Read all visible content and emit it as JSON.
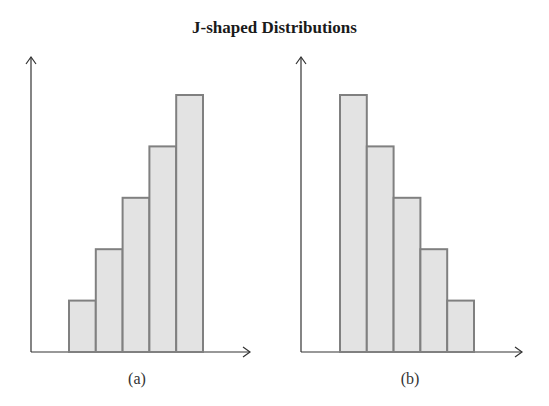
{
  "title": "J-shaped Distributions",
  "colors": {
    "bar_fill": "#e3e3e3",
    "bar_stroke": "#808080",
    "axis": "#333333"
  },
  "chart_data": [
    {
      "type": "bar",
      "title": "J-shaped Distributions",
      "caption": "(a)",
      "categories": [
        "1",
        "2",
        "3",
        "4",
        "5"
      ],
      "values": [
        1,
        2,
        3,
        4,
        5
      ],
      "xlabel": "",
      "ylabel": "",
      "grid": false,
      "note": "relative heights; no tick labels shown"
    },
    {
      "type": "bar",
      "title": "J-shaped Distributions",
      "caption": "(b)",
      "categories": [
        "1",
        "2",
        "3",
        "4",
        "5"
      ],
      "values": [
        5,
        4,
        3,
        2,
        1
      ],
      "xlabel": "",
      "ylabel": "",
      "grid": false,
      "note": "relative heights; no tick labels shown"
    }
  ]
}
